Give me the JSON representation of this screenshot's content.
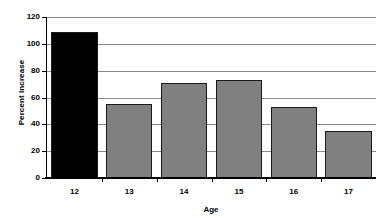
{
  "chart_data": {
    "type": "bar",
    "title": "",
    "xlabel": "Age",
    "ylabel": "Percent Increase",
    "categories": [
      "12",
      "13",
      "14",
      "15",
      "16",
      "17"
    ],
    "values": [
      109,
      55,
      71,
      73,
      53,
      35
    ],
    "ylim": [
      0,
      120
    ],
    "yticks": [
      0,
      20,
      40,
      60,
      80,
      100,
      120
    ],
    "ytick_labels": [
      "0",
      "20",
      "40",
      "60",
      "80",
      "100",
      "120"
    ],
    "grid": true,
    "legend": "none",
    "bar_colors": [
      "#000000",
      "#808080",
      "#808080",
      "#808080",
      "#808080",
      "#808080"
    ],
    "highlight_category": "12",
    "gridline_color": "#8a8a8a",
    "axis_color": "#000000",
    "background_color": "#ffffff"
  }
}
